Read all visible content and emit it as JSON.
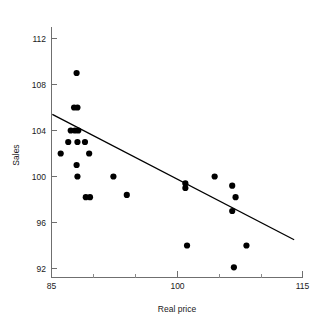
{
  "chart_data": {
    "type": "scatter",
    "title": "",
    "xlabel": "Real price",
    "ylabel": "Sales",
    "xlim": [
      85,
      115
    ],
    "ylim": [
      90.2,
      113.4
    ],
    "grid": false,
    "legend": "none",
    "x_ticks": [
      85,
      100,
      115
    ],
    "x_tick_labels": [
      "85",
      "100",
      "115"
    ],
    "x_minor_ticks": [
      90,
      95,
      105,
      110
    ],
    "y_ticks": [
      92,
      96,
      100,
      104,
      108,
      112
    ],
    "y_tick_labels": [
      "92",
      "96",
      "100",
      "104",
      "108",
      "112"
    ],
    "points": [
      {
        "x": 86.1,
        "y": 102.0
      },
      {
        "x": 87.0,
        "y": 103.0
      },
      {
        "x": 87.3,
        "y": 104.0
      },
      {
        "x": 87.7,
        "y": 106.0
      },
      {
        "x": 88.1,
        "y": 106.0
      },
      {
        "x": 87.8,
        "y": 104.0
      },
      {
        "x": 88.2,
        "y": 104.0
      },
      {
        "x": 88.0,
        "y": 109.0
      },
      {
        "x": 88.1,
        "y": 103.0
      },
      {
        "x": 88.0,
        "y": 101.0
      },
      {
        "x": 88.1,
        "y": 100.0
      },
      {
        "x": 89.0,
        "y": 103.0
      },
      {
        "x": 89.1,
        "y": 98.2
      },
      {
        "x": 89.5,
        "y": 102.0
      },
      {
        "x": 89.6,
        "y": 98.2
      },
      {
        "x": 92.4,
        "y": 100.0
      },
      {
        "x": 94.0,
        "y": 98.4
      },
      {
        "x": 101.0,
        "y": 99.4
      },
      {
        "x": 101.0,
        "y": 99.0
      },
      {
        "x": 101.2,
        "y": 94.0
      },
      {
        "x": 104.5,
        "y": 100.0
      },
      {
        "x": 106.6,
        "y": 99.2
      },
      {
        "x": 107.0,
        "y": 98.2
      },
      {
        "x": 106.6,
        "y": 97.0
      },
      {
        "x": 106.8,
        "y": 92.1
      },
      {
        "x": 108.3,
        "y": 94.0
      }
    ],
    "fit_line": {
      "x_start": 85.1,
      "y_start": 105.4,
      "x_end": 114.0,
      "y_end": 94.5,
      "style": "solid",
      "color": "#000000"
    }
  },
  "axes": {
    "x_axis_name": "x-axis",
    "y_axis_name": "y-axis"
  }
}
